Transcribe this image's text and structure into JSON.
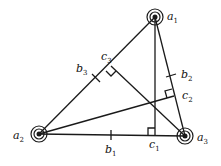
{
  "diagram": {
    "type": "triangle-with-altitudes",
    "colors": {
      "stroke": "#1a1a1a",
      "background": "#ffffff"
    },
    "vertices": [
      {
        "id": "a1",
        "label": "a",
        "sub": "1",
        "x": 155,
        "y": 17
      },
      {
        "id": "a2",
        "label": "a",
        "sub": "2",
        "x": 39,
        "y": 134
      },
      {
        "id": "a3",
        "label": "a",
        "sub": "3",
        "x": 185,
        "y": 136
      }
    ],
    "midpoints": [
      {
        "id": "b1",
        "label": "b",
        "sub": "1"
      },
      {
        "id": "b2",
        "label": "b",
        "sub": "2"
      },
      {
        "id": "b3",
        "label": "b",
        "sub": "3"
      }
    ],
    "feet": [
      {
        "id": "c1",
        "label": "c",
        "sub": "1"
      },
      {
        "id": "c2",
        "label": "c",
        "sub": "2"
      },
      {
        "id": "c3",
        "label": "c",
        "sub": "3"
      }
    ]
  }
}
